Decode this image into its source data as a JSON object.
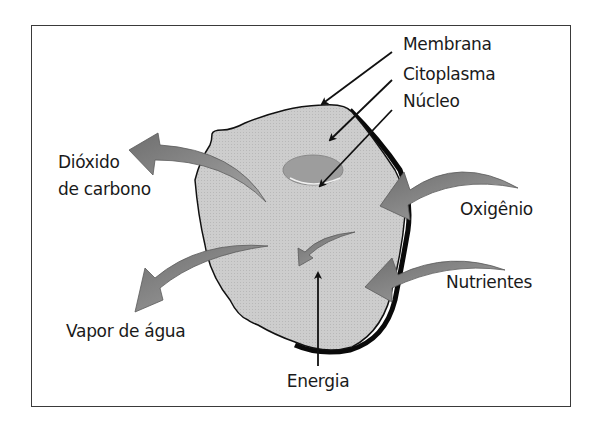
{
  "diagram": {
    "type": "cell-metabolism",
    "labels": {
      "membrana": "Membrana",
      "citoplasma": "Citoplasma",
      "nucleo": "Núcleo",
      "dioxido_line1": "Dióxido",
      "dioxido_line2": "de carbono",
      "vapor": "Vapor de água",
      "oxigenio": "Oxigênio",
      "nutrientes": "Nutrientes",
      "energia_line1": "Energia",
      "energia_line2": "utilizável",
      "energia_line3": "pela célula"
    },
    "colors": {
      "cell_fill": "#c8c8c8",
      "nucleus_fill": "#9a9a9a",
      "arrow_fill": "#8a8a8a",
      "outline": "#111111",
      "frame": "#3a3a3a"
    },
    "inputs": [
      "Oxigênio",
      "Nutrientes"
    ],
    "outputs": [
      "Dióxido de carbono",
      "Vapor de água",
      "Energia utilizável pela célula"
    ]
  }
}
